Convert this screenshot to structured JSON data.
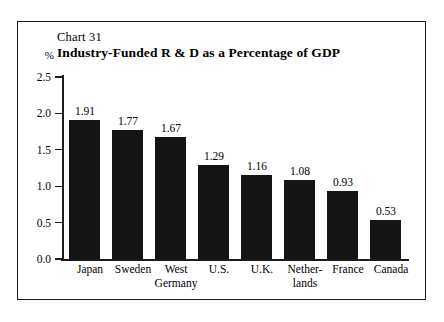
{
  "figure": {
    "chart_number": "Chart 31",
    "title": "Industry-Funded R & D as a Percentage of GDP",
    "unit_label": "%"
  },
  "chart_data": {
    "type": "bar",
    "title": "Industry-Funded R & D as a Percentage of GDP",
    "subtitle": "Chart 31",
    "xlabel": "",
    "ylabel": "%",
    "ylim": [
      0.0,
      2.5
    ],
    "yticks": [
      "0.0",
      "0.5",
      "1.0",
      "1.5",
      "2.0",
      "2.5"
    ],
    "ytick_values": [
      0.0,
      0.5,
      1.0,
      1.5,
      2.0,
      2.5
    ],
    "grid": false,
    "legend": "none",
    "bar_color": "#141414",
    "categories": [
      "Japan",
      "Sweden",
      "West Germany",
      "U.S.",
      "U.K.",
      "Netherlands",
      "France",
      "Canada"
    ],
    "category_lines": [
      [
        "Japan"
      ],
      [
        "Sweden"
      ],
      [
        "West",
        "Germany"
      ],
      [
        "U.S."
      ],
      [
        "U.K."
      ],
      [
        "Nether-",
        "lands"
      ],
      [
        "France"
      ],
      [
        "Canada"
      ]
    ],
    "values": [
      1.91,
      1.77,
      1.67,
      1.29,
      1.16,
      1.08,
      0.93,
      0.53
    ],
    "value_labels": [
      "1.91",
      "1.77",
      "1.67",
      "1.29",
      "1.16",
      "1.08",
      "0.93",
      "0.53"
    ]
  }
}
